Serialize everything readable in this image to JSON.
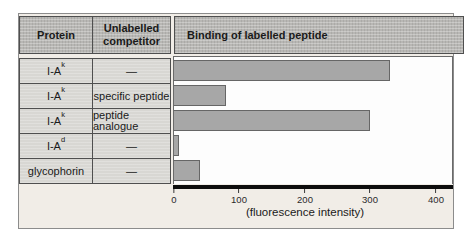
{
  "table": {
    "col_headers": [
      "Protein",
      "Unlabelled competitor"
    ]
  },
  "chart_data": {
    "type": "bar",
    "orientation": "horizontal",
    "title": "Binding of labelled peptide",
    "xlabel": "(fluorescence intensity)",
    "xlim": [
      0,
      425
    ],
    "xticks": [
      "0",
      "100",
      "200",
      "300",
      "400"
    ],
    "xtick_values": [
      0,
      100,
      200,
      300,
      400
    ],
    "grid": false,
    "legend": "none",
    "rows": [
      {
        "protein_base": "I-A",
        "protein_sup": "k",
        "competitor": "—",
        "value": 330
      },
      {
        "protein_base": "I-A",
        "protein_sup": "k",
        "competitor": "specific peptide",
        "value": 80
      },
      {
        "protein_base": "I-A",
        "protein_sup": "k",
        "competitor": "peptide analogue",
        "value": 300
      },
      {
        "protein_base": "I-A",
        "protein_sup": "d",
        "competitor": "—",
        "value": 8
      },
      {
        "protein_base": "glycophorin",
        "protein_sup": "",
        "competitor": "—",
        "value": 40
      }
    ],
    "colors": {
      "bar_fill": "#a7a7a7",
      "bar_border": "#666666",
      "header_fill": "#b8b7b4",
      "row_fill": "#d8d7d3",
      "figure_bg": "#f1ede7",
      "axis_line": "#0d0d0d"
    }
  }
}
